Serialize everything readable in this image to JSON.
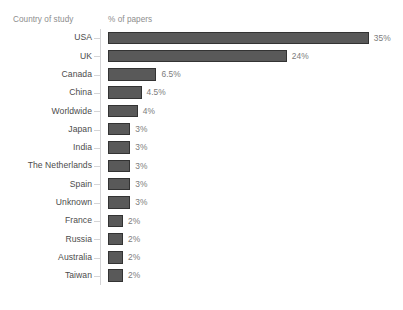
{
  "title_fragment": "",
  "headers": {
    "category": "Country of study",
    "value": "% of papers"
  },
  "colors": {
    "bar_fill": "#595959",
    "bar_border": "#333333",
    "axis_line": "#d4d4d6",
    "label_text": "#4c4c4c",
    "value_text": "#7c7c7c",
    "header_text": "#8d8d8d",
    "background": "#ffffff"
  },
  "chart_data": {
    "type": "bar",
    "orientation": "horizontal",
    "title": "",
    "xlabel": "% of papers",
    "ylabel": "Country of study",
    "grid": false,
    "legend": false,
    "xlim": [
      0,
      35
    ],
    "categories": [
      "USA",
      "UK",
      "Canada",
      "China",
      "Worldwide",
      "Japan",
      "India",
      "The Netherlands",
      "Spain",
      "Unknown",
      "France",
      "Russia",
      "Australia",
      "Taiwan"
    ],
    "values": [
      35,
      24,
      6.5,
      4.5,
      4,
      3,
      3,
      3,
      3,
      3,
      2,
      2,
      2,
      2
    ],
    "data_labels": [
      "35%",
      "24%",
      "6.5%",
      "4.5%",
      "4%",
      "3%",
      "3%",
      "3%",
      "3%",
      "3%",
      "2%",
      "2%",
      "2%",
      "2%"
    ]
  }
}
